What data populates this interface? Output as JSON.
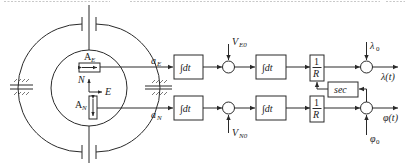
{
  "diagram": {
    "type": "block-diagram",
    "platform": {
      "accelerometer_east": {
        "label": "A",
        "sub": "E"
      },
      "accelerometer_north": {
        "label": "A",
        "sub": "N"
      },
      "axis_north": "N",
      "axis_east": "E"
    },
    "east_channel": {
      "input": {
        "label": "a",
        "sub": "E"
      },
      "integrator1": "∫dt",
      "initial_velocity": {
        "label": "V",
        "sub": "E0"
      },
      "integrator2": "∫dt",
      "gain": {
        "num": "1",
        "den": "R"
      },
      "initial_position": {
        "label": "λ",
        "sub": "0"
      },
      "output": "λ(t)"
    },
    "north_channel": {
      "input": {
        "label": "a",
        "sub": "N"
      },
      "integrator1": "∫dt",
      "initial_velocity": {
        "label": "V",
        "sub": "N0"
      },
      "integrator2": "∫dt",
      "gain": {
        "num": "1",
        "den": "R"
      },
      "initial_position": {
        "label": "φ",
        "sub": "0"
      },
      "output": "φ(t)"
    },
    "feedback": {
      "block": "sec"
    }
  }
}
